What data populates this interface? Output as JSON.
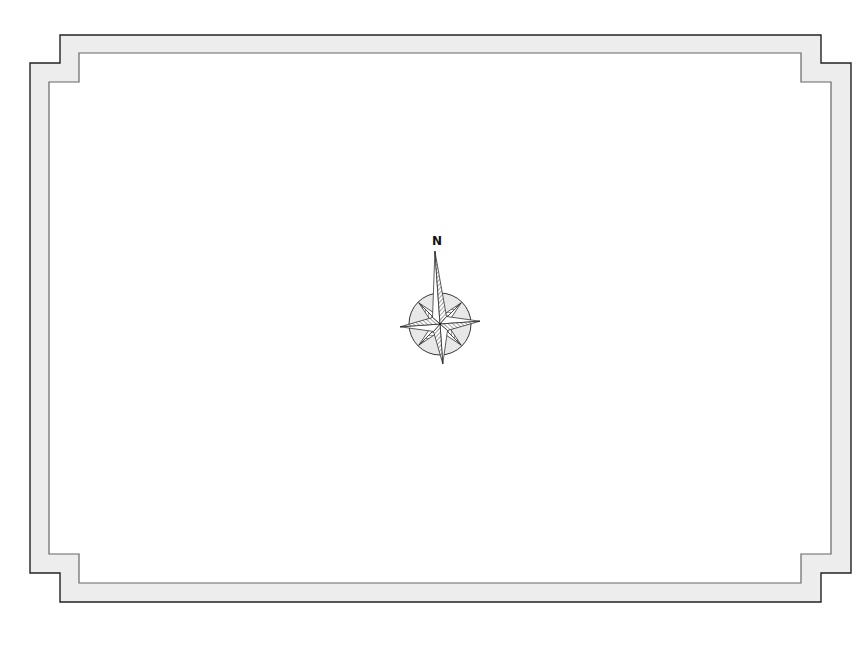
{
  "map": {
    "type": "blank-map-frame",
    "background_color": "#ffffff",
    "frame": {
      "style": "stepped-corner double border",
      "fill_color": "#ededed",
      "outer_stroke_color": "#222222",
      "inner_stroke_color": "#666666"
    },
    "compass_rose": {
      "north_label": "N",
      "points": 8,
      "ring_fill_color": "#e8e8e8",
      "stroke_color": "#222222",
      "hatch_color": "#555555"
    }
  }
}
